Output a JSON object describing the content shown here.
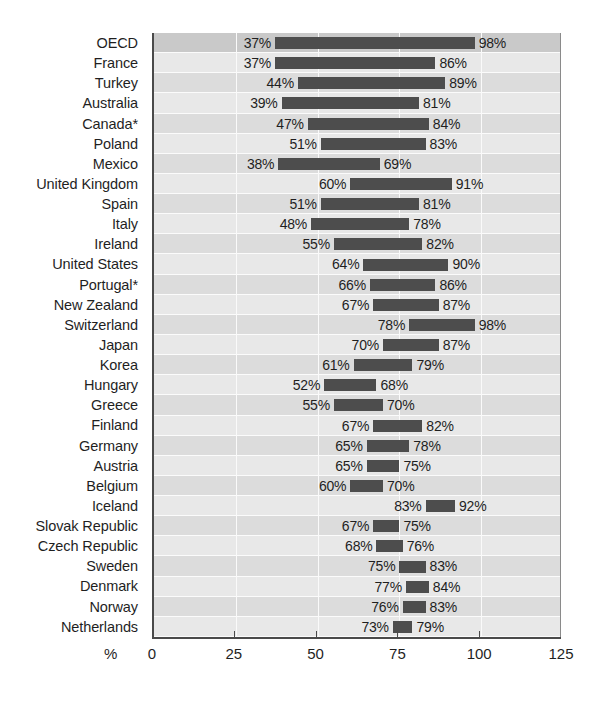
{
  "chart_data": {
    "type": "bar",
    "subtype": "floating-range-bar",
    "title": "",
    "subtitle": "",
    "xlabel": "%",
    "ylabel": "",
    "xlim": [
      0,
      125
    ],
    "xticks": [
      0,
      25,
      50,
      75,
      100,
      125
    ],
    "xtick_labels": [
      "0",
      "25",
      "50",
      "75",
      "100",
      "125"
    ],
    "grid": true,
    "grid_axis": "x",
    "legend": null,
    "orientation": "horizontal",
    "value_label_suffix": "%",
    "bar_color": "#4d4d4d",
    "row_band_color": "#dcdcdc",
    "highlight_row_color": "#c9c9c9",
    "axis_color": "#4a4a4a",
    "categories": [
      "OECD",
      "France",
      "Turkey",
      "Australia",
      "Canada*",
      "Poland",
      "Mexico",
      "United Kingdom",
      "Spain",
      "Italy",
      "Ireland",
      "United States",
      "Portugal*",
      "New Zealand",
      "Switzerland",
      "Japan",
      "Korea",
      "Hungary",
      "Greece",
      "Finland",
      "Germany",
      "Austria",
      "Belgium",
      "Iceland",
      "Slovak Republic",
      "Czech Republic",
      "Sweden",
      "Denmark",
      "Norway",
      "Netherlands"
    ],
    "series": [
      {
        "name": "Low",
        "values": [
          37,
          37,
          44,
          39,
          47,
          51,
          38,
          60,
          51,
          48,
          55,
          64,
          66,
          67,
          78,
          70,
          61,
          52,
          55,
          67,
          65,
          65,
          60,
          83,
          67,
          68,
          75,
          77,
          76,
          73
        ]
      },
      {
        "name": "High",
        "values": [
          98,
          86,
          89,
          81,
          84,
          83,
          69,
          91,
          81,
          78,
          82,
          90,
          86,
          87,
          98,
          87,
          79,
          68,
          70,
          82,
          78,
          75,
          70,
          92,
          75,
          76,
          83,
          84,
          83,
          79
        ]
      }
    ],
    "rows": [
      {
        "category": "OECD",
        "low": 37,
        "high": 98,
        "low_label": "37%",
        "high_label": "98%",
        "highlight": true
      },
      {
        "category": "France",
        "low": 37,
        "high": 86,
        "low_label": "37%",
        "high_label": "86%",
        "highlight": false
      },
      {
        "category": "Turkey",
        "low": 44,
        "high": 89,
        "low_label": "44%",
        "high_label": "89%",
        "highlight": false
      },
      {
        "category": "Australia",
        "low": 39,
        "high": 81,
        "low_label": "39%",
        "high_label": "81%",
        "highlight": false
      },
      {
        "category": "Canada*",
        "low": 47,
        "high": 84,
        "low_label": "47%",
        "high_label": "84%",
        "highlight": false
      },
      {
        "category": "Poland",
        "low": 51,
        "high": 83,
        "low_label": "51%",
        "high_label": "83%",
        "highlight": false
      },
      {
        "category": "Mexico",
        "low": 38,
        "high": 69,
        "low_label": "38%",
        "high_label": "69%",
        "highlight": false
      },
      {
        "category": "United Kingdom",
        "low": 60,
        "high": 91,
        "low_label": "60%",
        "high_label": "91%",
        "highlight": false
      },
      {
        "category": "Spain",
        "low": 51,
        "high": 81,
        "low_label": "51%",
        "high_label": "81%",
        "highlight": false
      },
      {
        "category": "Italy",
        "low": 48,
        "high": 78,
        "low_label": "48%",
        "high_label": "78%",
        "highlight": false
      },
      {
        "category": "Ireland",
        "low": 55,
        "high": 82,
        "low_label": "55%",
        "high_label": "82%",
        "highlight": false
      },
      {
        "category": "United States",
        "low": 64,
        "high": 90,
        "low_label": "64%",
        "high_label": "90%",
        "highlight": false
      },
      {
        "category": "Portugal*",
        "low": 66,
        "high": 86,
        "low_label": "66%",
        "high_label": "86%",
        "highlight": false
      },
      {
        "category": "New Zealand",
        "low": 67,
        "high": 87,
        "low_label": "67%",
        "high_label": "87%",
        "highlight": false
      },
      {
        "category": "Switzerland",
        "low": 78,
        "high": 98,
        "low_label": "78%",
        "high_label": "98%",
        "highlight": false
      },
      {
        "category": "Japan",
        "low": 70,
        "high": 87,
        "low_label": "70%",
        "high_label": "87%",
        "highlight": false
      },
      {
        "category": "Korea",
        "low": 61,
        "high": 79,
        "low_label": "61%",
        "high_label": "79%",
        "highlight": false
      },
      {
        "category": "Hungary",
        "low": 52,
        "high": 68,
        "low_label": "52%",
        "high_label": "68%",
        "highlight": false
      },
      {
        "category": "Greece",
        "low": 55,
        "high": 70,
        "low_label": "55%",
        "high_label": "70%",
        "highlight": false
      },
      {
        "category": "Finland",
        "low": 67,
        "high": 82,
        "low_label": "67%",
        "high_label": "82%",
        "highlight": false
      },
      {
        "category": "Germany",
        "low": 65,
        "high": 78,
        "low_label": "65%",
        "high_label": "78%",
        "highlight": false
      },
      {
        "category": "Austria",
        "low": 65,
        "high": 75,
        "low_label": "65%",
        "high_label": "75%",
        "highlight": false
      },
      {
        "category": "Belgium",
        "low": 60,
        "high": 70,
        "low_label": "60%",
        "high_label": "70%",
        "highlight": false
      },
      {
        "category": "Iceland",
        "low": 83,
        "high": 92,
        "low_label": "83%",
        "high_label": "92%",
        "highlight": false
      },
      {
        "category": "Slovak Republic",
        "low": 67,
        "high": 75,
        "low_label": "67%",
        "high_label": "75%",
        "highlight": false
      },
      {
        "category": "Czech Republic",
        "low": 68,
        "high": 76,
        "low_label": "68%",
        "high_label": "76%",
        "highlight": false
      },
      {
        "category": "Sweden",
        "low": 75,
        "high": 83,
        "low_label": "75%",
        "high_label": "83%",
        "highlight": false
      },
      {
        "category": "Denmark",
        "low": 77,
        "high": 84,
        "low_label": "77%",
        "high_label": "84%",
        "highlight": false
      },
      {
        "category": "Norway",
        "low": 76,
        "high": 83,
        "low_label": "76%",
        "high_label": "83%",
        "highlight": false
      },
      {
        "category": "Netherlands",
        "low": 73,
        "high": 79,
        "low_label": "73%",
        "high_label": "79%",
        "highlight": false
      }
    ]
  }
}
